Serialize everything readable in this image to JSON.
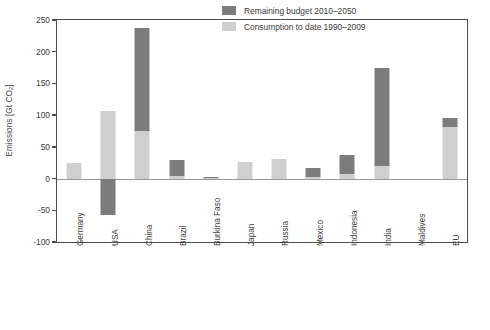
{
  "chart_data": {
    "type": "bar",
    "title": "",
    "subtitle": "",
    "xlabel": "",
    "ylabel": "Emissions [Gt CO2]",
    "ylabel_display": "Emissions [Gt CO₂]",
    "ylim": [
      -100,
      250
    ],
    "yticks": [
      250,
      200,
      150,
      100,
      50,
      0,
      -50,
      -100
    ],
    "ytick_labels": [
      "250",
      "200",
      "150",
      "100",
      "50",
      "0",
      "-50",
      "-100"
    ],
    "grid": false,
    "stacked": true,
    "legend_position": "upper right inside",
    "categories": [
      "Germany",
      "USA",
      "China",
      "Brazil",
      "Burkina Faso",
      "Japan",
      "Russia",
      "Mexico",
      "Indonesia",
      "India",
      "Maldives",
      "EU"
    ],
    "series": [
      {
        "name": "Consumption to date 1990–2009",
        "color": "#cfcfcf",
        "values": [
          25,
          107,
          75,
          4,
          1,
          26,
          31,
          2,
          7,
          20,
          0,
          82
        ]
      },
      {
        "name": "Remaining budget 2010–2050",
        "color": "#7c7c7c",
        "values": [
          0,
          -57,
          163,
          26,
          1,
          0,
          0,
          14,
          30,
          154,
          0,
          14
        ]
      }
    ],
    "series_totals_visible": {
      "Germany": 25,
      "USA": 107,
      "China": 238,
      "Brazil": 30,
      "Burkina Faso": 2,
      "Japan": 26,
      "Russia": 31,
      "Mexico": 16,
      "Indonesia": 37,
      "India": 174,
      "Maldives": 0,
      "EU": 96
    }
  },
  "legend": {
    "items": [
      {
        "label": "Remaining budget 2010–2050",
        "swatch": "dark"
      },
      {
        "label": "Consumption to date 1990–2009",
        "swatch": "light"
      }
    ]
  }
}
